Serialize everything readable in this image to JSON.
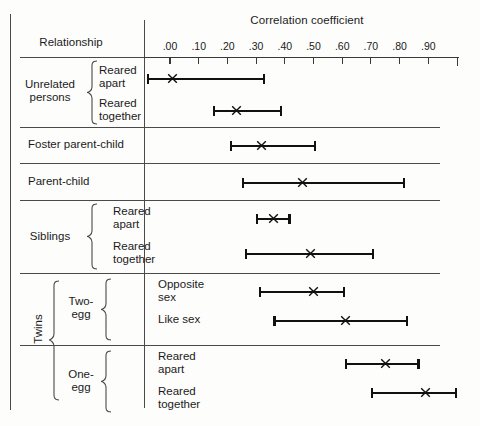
{
  "chart_data": {
    "type": "bar",
    "title": "Correlation coefficient",
    "xlabel": "Correlation coefficient",
    "ylabel": "Relationship",
    "xlim": [
      -0.07,
      1.0
    ],
    "grid": false,
    "legend": null,
    "tick_labels": [
      ".00",
      ".10",
      ".20",
      ".30",
      ".40",
      ".50",
      ".60",
      ".70",
      ".80",
      ".90"
    ],
    "tick_values": [
      0.0,
      0.1,
      0.2,
      0.3,
      0.4,
      0.5,
      0.6,
      0.7,
      0.8,
      0.9
    ],
    "annotation": "Each horizontal bar spans the range of reported correlations; the X marks the median/average correlation.",
    "categories": [
      "Unrelated persons — Reared apart",
      "Unrelated persons — Reared together",
      "Foster parent-child",
      "Parent-child",
      "Siblings — Reared apart",
      "Siblings — Reared together",
      "Twins, Two-egg — Opposite sex",
      "Twins, Two-egg — Like sex",
      "Twins, One-egg — Reared apart",
      "Twins, One-egg — Reared together"
    ],
    "series": [
      {
        "name": "Range low",
        "values": [
          -0.08,
          0.15,
          0.21,
          0.25,
          0.3,
          0.26,
          0.31,
          0.36,
          0.61,
          0.7
        ]
      },
      {
        "name": "Median (X)",
        "values": [
          0.01,
          0.23,
          0.32,
          0.46,
          0.36,
          0.49,
          0.5,
          0.61,
          0.75,
          0.89
        ]
      },
      {
        "name": "Range high",
        "values": [
          0.33,
          0.39,
          0.51,
          0.82,
          0.42,
          0.71,
          0.61,
          0.83,
          0.87,
          1.0
        ]
      }
    ]
  },
  "header": {
    "axis_title": "Correlation coefficient",
    "relationship_header": "Relationship"
  },
  "rows": [
    {
      "label_line1": "Reared",
      "label_line2": "apart"
    },
    {
      "label_line1": "Reared",
      "label_line2": "together"
    },
    {
      "label_line1": "Foster parent-child",
      "label_line2": ""
    },
    {
      "label_line1": "Parent-child",
      "label_line2": ""
    },
    {
      "label_line1": "Reared",
      "label_line2": "apart"
    },
    {
      "label_line1": "Reared",
      "label_line2": "together"
    },
    {
      "label_line1": "Opposite",
      "label_line2": "sex"
    },
    {
      "label_line1": "Like sex",
      "label_line2": ""
    },
    {
      "label_line1": "Reared",
      "label_line2": "apart"
    },
    {
      "label_line1": "Reared",
      "label_line2": "together"
    }
  ],
  "groups": {
    "unrelated_line1": "Unrelated",
    "unrelated_line2": "persons",
    "siblings": "Siblings",
    "twins": "Twins",
    "two_egg_line1": "Two-",
    "two_egg_line2": "egg",
    "one_egg_line1": "One-",
    "one_egg_line2": "egg"
  },
  "colors": {
    "bar": "#111111",
    "rule": "#4a4a4a",
    "axis": "#3a3a3a",
    "background": "#fdfdfc",
    "text": "#1b1b1b"
  }
}
